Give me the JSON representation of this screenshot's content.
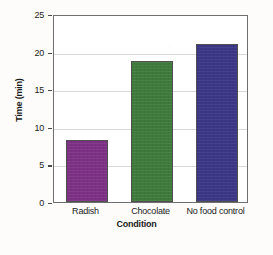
{
  "chart_data": {
    "type": "bar",
    "title": "",
    "xlabel": "Condition",
    "ylabel": "Time (min)",
    "categories": [
      "Radish",
      "Chocolate",
      "No food control"
    ],
    "values": [
      8.3,
      18.8,
      21.0
    ],
    "ylim": [
      0,
      25
    ],
    "yticks": [
      0,
      5,
      10,
      15,
      20,
      25
    ],
    "ytick_labels": [
      "0",
      "5",
      "10",
      "15",
      "20",
      "25"
    ],
    "grid": "horizontal",
    "legend": "none",
    "bar_colors": [
      "#7d3185",
      "#3f7a3c",
      "#3b3786"
    ],
    "bar_edge_color": "#4f4f4f",
    "axis_color": "#6e6e6e",
    "grid_color": "#d8d8d8",
    "background": "#ffffff"
  }
}
